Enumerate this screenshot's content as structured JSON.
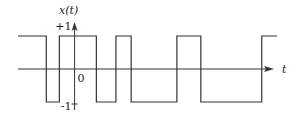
{
  "chart_data": {
    "type": "line",
    "title": "",
    "ylabel": "x(t)",
    "xlabel": "t",
    "y_ticks": [
      {
        "value": 1,
        "label": "+1"
      },
      {
        "value": -1,
        "label": "-1"
      }
    ],
    "origin_label": "0",
    "ylim": [
      -1,
      1
    ],
    "xlim": [
      -2.6,
      9.3
    ],
    "transitions_t": [
      -1.3,
      -0.7,
      1.0,
      1.9,
      2.6,
      4.7,
      5.8,
      8.6
    ],
    "initial_value": 1,
    "t_end": 9.3
  },
  "colors": {
    "stroke": "#333333",
    "background": "#ffffff"
  }
}
